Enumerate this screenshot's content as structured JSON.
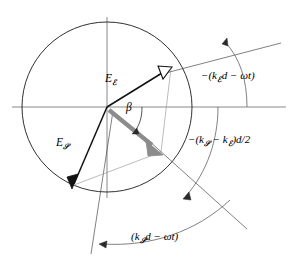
{
  "figure": {
    "name": "phasor-diagram-birefringent-retarder",
    "background_color": "#ffffff",
    "line_color": "#000000",
    "gray_arrow_color": "#8c8c8c",
    "axis_color": "#555555"
  },
  "geometry": {
    "origin": {
      "x": 107,
      "y": 107
    },
    "circle_radius": 85,
    "fast_vector_tip": {
      "x": 171,
      "y": 67
    },
    "slow_vector_tip": {
      "x": 73,
      "y": 186
    },
    "resultant_tip": {
      "x": 161,
      "y": 153
    }
  },
  "labels": {
    "fast_vector": {
      "base": "E",
      "subscript": "ℰ"
    },
    "slow_vector": {
      "base": "E",
      "subscript": "𝒮"
    },
    "beta_angle": "β",
    "angle_fast": {
      "text_prefix": "−(k",
      "subscript": "ℰ",
      "text_suffix": "d − ωt)",
      "full": "−(kℰd − ωt)"
    },
    "angle_difference": {
      "text_prefix": "−(k",
      "subscript_1": "𝒮",
      "text_middle": " − k",
      "subscript_2": "ℰ",
      "text_suffix": ")d/2",
      "full": "−(k𝒮 − kℰ)d/2"
    },
    "angle_slow": {
      "text_prefix": "(k",
      "subscript": "𝒮",
      "text_suffix": "d − ωt)",
      "full": "(k𝒮d − ωt)"
    }
  }
}
